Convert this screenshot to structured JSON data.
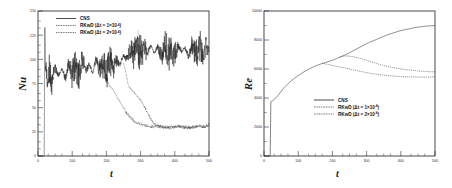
{
  "figure": {
    "panel_count": 2
  },
  "chart_data": [
    {
      "id": "nusselt-panel",
      "type": "line",
      "title": "",
      "xlabel": "t",
      "ylabel": "Nu",
      "xlim": [
        0,
        500
      ],
      "ylim": [
        0,
        150
      ],
      "xticks": [
        0,
        100,
        200,
        300,
        400,
        500
      ],
      "xticklabels": [
        "0",
        "100",
        "200",
        "300",
        "400",
        "500"
      ],
      "yticks": [
        0,
        25,
        50,
        75,
        100,
        125,
        150
      ],
      "yticklabels": [
        "0",
        "25",
        "50",
        "75",
        "100",
        "125",
        "150"
      ],
      "grid": false,
      "legend_position": "upper-left",
      "series": [
        {
          "name": "CNS",
          "style": "solid",
          "color": "#202020",
          "description": "Highly oscillatory turbulent Nusselt signal; rises abruptly from 0 at t=20 to a spike of about 133, settles into chaotic fluctuation with mean near 88 for 40<t<230, then shifts upward to a mean near 107 with band 90-125 for t>260",
          "x": [
            0,
            18,
            20,
            22,
            26,
            32,
            40,
            50,
            60,
            70,
            80,
            90,
            100,
            110,
            120,
            130,
            140,
            150,
            160,
            170,
            180,
            190,
            200,
            210,
            220,
            230,
            240,
            250,
            260,
            270,
            280,
            290,
            300,
            310,
            320,
            330,
            340,
            350,
            360,
            370,
            380,
            390,
            400,
            410,
            420,
            430,
            440,
            450,
            460,
            470,
            480,
            490,
            500
          ],
          "y": [
            0,
            0,
            133,
            96,
            80,
            88,
            76,
            92,
            83,
            90,
            80,
            94,
            86,
            96,
            84,
            99,
            88,
            95,
            86,
            100,
            90,
            97,
            88,
            101,
            92,
            99,
            95,
            104,
            100,
            110,
            104,
            113,
            106,
            112,
            105,
            114,
            107,
            112,
            104,
            113,
            106,
            111,
            105,
            114,
            108,
            112,
            104,
            113,
            107,
            111,
            105,
            113,
            108
          ],
          "noise_band": 18
        },
        {
          "name": "RKwD (Δt = 1×10⁻⁴)",
          "style": "dotted",
          "color": "#202020",
          "description": "Follows CNS until t≈255 then departs, decaying from 90 down to a low plateau near 30 by t≈350 and fluctuating mildly around 30 thereafter",
          "x": [
            250,
            255,
            260,
            265,
            270,
            280,
            290,
            300,
            310,
            320,
            330,
            340,
            350,
            370,
            390,
            410,
            430,
            450,
            470,
            490,
            500
          ],
          "y": [
            96,
            90,
            80,
            72,
            70,
            66,
            62,
            58,
            52,
            45,
            38,
            33,
            31,
            30,
            29,
            31,
            30,
            29,
            31,
            30,
            33
          ]
        },
        {
          "name": "RKwD (Δt = 2×10⁻⁴)",
          "style": "dotted",
          "color": "#202020",
          "description": "Departs earlier near t≈195, decaying from 90 to about 32 by t≈310 and fluctuating around 30 thereafter",
          "x": [
            190,
            195,
            200,
            210,
            220,
            230,
            240,
            250,
            260,
            270,
            280,
            290,
            300,
            310,
            330,
            350,
            370,
            390,
            410,
            430,
            450,
            470,
            490,
            500
          ],
          "y": [
            92,
            88,
            80,
            72,
            68,
            62,
            56,
            50,
            44,
            40,
            36,
            34,
            33,
            32,
            30,
            31,
            29,
            30,
            31,
            29,
            30,
            31,
            30,
            32
          ]
        }
      ]
    },
    {
      "id": "reynolds-panel",
      "type": "line",
      "title": "",
      "xlabel": "t",
      "ylabel": "Re",
      "xlim": [
        0,
        500
      ],
      "ylim": [
        0,
        10000
      ],
      "xticks": [
        0,
        100,
        200,
        300,
        400,
        500
      ],
      "xticklabels": [
        "0",
        "100",
        "200",
        "300",
        "400",
        "500"
      ],
      "yticks": [
        0,
        2000,
        4000,
        6000,
        8000,
        10000
      ],
      "yticklabels": [
        "0",
        "2000",
        "4000",
        "6000",
        "8000",
        "10000"
      ],
      "grid": false,
      "legend_position": "lower-right",
      "series": [
        {
          "name": "CNS",
          "style": "solid",
          "color": "#202020",
          "description": "Flat at 0 until t≈20, jumps to about 3800, then grows monotonically and concavely to about 9000 at t=500",
          "x": [
            0,
            18,
            20,
            24,
            30,
            40,
            50,
            60,
            80,
            100,
            120,
            140,
            160,
            180,
            200,
            220,
            240,
            260,
            280,
            300,
            320,
            340,
            360,
            380,
            400,
            420,
            440,
            460,
            480,
            500
          ],
          "y": [
            0,
            0,
            3750,
            3800,
            3900,
            4150,
            4450,
            4750,
            5200,
            5550,
            5850,
            6100,
            6300,
            6450,
            6600,
            6800,
            7000,
            7250,
            7500,
            7750,
            7950,
            8150,
            8350,
            8500,
            8650,
            8750,
            8850,
            8920,
            8970,
            9000
          ]
        },
        {
          "name": "RKwD (Δt = 1×10⁻⁴)",
          "style": "dotted",
          "color": "#202020",
          "description": "Tracks CNS to t≈230 then levels off, peaking near 6900 and slowly declining to about 5800 at t=500",
          "x": [
            220,
            230,
            240,
            250,
            260,
            280,
            300,
            320,
            340,
            360,
            380,
            400,
            420,
            440,
            460,
            480,
            500
          ],
          "y": [
            6800,
            6880,
            6900,
            6880,
            6850,
            6750,
            6600,
            6450,
            6300,
            6180,
            6080,
            6000,
            5940,
            5890,
            5850,
            5820,
            5800
          ]
        },
        {
          "name": "RKwD (Δt = 2×10⁻⁴)",
          "style": "dotted",
          "color": "#202020",
          "description": "Departs near t≈175, rising slightly to about 6300 then settling near 5450 at t=500",
          "x": [
            170,
            180,
            190,
            200,
            220,
            240,
            260,
            280,
            300,
            320,
            340,
            360,
            380,
            400,
            420,
            440,
            460,
            480,
            500
          ],
          "y": [
            6400,
            6350,
            6300,
            6250,
            6150,
            6050,
            5950,
            5850,
            5750,
            5670,
            5600,
            5550,
            5510,
            5480,
            5460,
            5450,
            5440,
            5440,
            5450
          ]
        }
      ]
    }
  ],
  "legend": {
    "entries": [
      {
        "label": "CNS",
        "suffix": "",
        "sup": "",
        "style": "solid"
      },
      {
        "label": "RKwD (Δt = 1×10",
        "suffix": ")",
        "sup": "-4",
        "style": "dotted"
      },
      {
        "label": "RKwD (Δt = 2×10",
        "suffix": ")",
        "sup": "-4",
        "style": "dotted"
      }
    ]
  },
  "colors": {
    "ink": "#202020",
    "background": "#ffffff"
  }
}
